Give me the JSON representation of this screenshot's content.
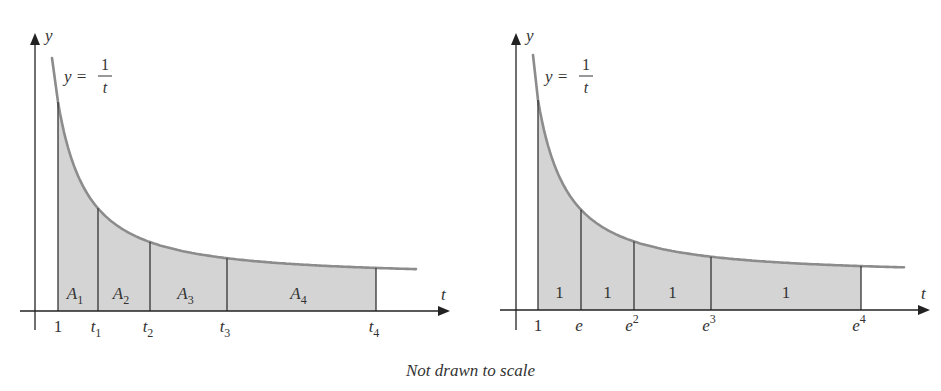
{
  "panels": [
    {
      "id": "left",
      "y_axis_label": "y",
      "x_axis_label": "t",
      "equation": {
        "lhs": "y =",
        "numerator": "1",
        "denominator": "t"
      },
      "tick_labels": [
        {
          "base": "1",
          "sub": "",
          "sup": ""
        },
        {
          "base": "t",
          "sub": "1",
          "sup": ""
        },
        {
          "base": "t",
          "sub": "2",
          "sup": ""
        },
        {
          "base": "t",
          "sub": "3",
          "sup": ""
        },
        {
          "base": "t",
          "sub": "4",
          "sup": ""
        }
      ],
      "region_labels": [
        {
          "base": "A",
          "sub": "1"
        },
        {
          "base": "A",
          "sub": "2"
        },
        {
          "base": "A",
          "sub": "3"
        },
        {
          "base": "A",
          "sub": "4"
        }
      ]
    },
    {
      "id": "right",
      "y_axis_label": "y",
      "x_axis_label": "t",
      "equation": {
        "lhs": "y =",
        "numerator": "1",
        "denominator": "t"
      },
      "tick_labels": [
        {
          "base": "1",
          "sub": "",
          "sup": ""
        },
        {
          "base": "e",
          "sub": "",
          "sup": ""
        },
        {
          "base": "e",
          "sub": "",
          "sup": "2"
        },
        {
          "base": "e",
          "sub": "",
          "sup": "3"
        },
        {
          "base": "e",
          "sub": "",
          "sup": "4"
        }
      ],
      "region_labels": [
        {
          "base": "1",
          "sub": ""
        },
        {
          "base": "1",
          "sub": ""
        },
        {
          "base": "1",
          "sub": ""
        },
        {
          "base": "1",
          "sub": ""
        }
      ]
    }
  ],
  "caption": "Not drawn to scale",
  "colors": {
    "fill": "#d4d4d4",
    "curve": "#8c8c8c",
    "axis": "#222222"
  }
}
